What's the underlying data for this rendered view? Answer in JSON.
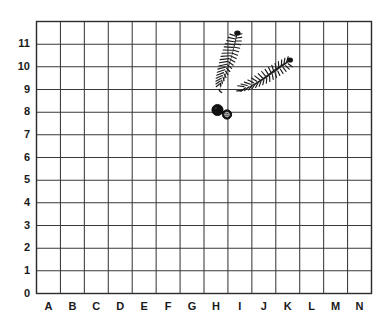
{
  "figure": {
    "kind": "excavation-grid-plot",
    "background_color": "#ffffff",
    "grid_line_color": "#3a3a3a",
    "artifact_color": "#1a1a1a"
  },
  "chart_data": {
    "type": "scatter",
    "title": "",
    "subtitle": "",
    "xlabel": "",
    "ylabel": "",
    "grid": true,
    "legend": "none",
    "x_axis": {
      "type": "category",
      "tick_labels": [
        "A",
        "B",
        "C",
        "D",
        "E",
        "F",
        "G",
        "H",
        "I",
        "J",
        "K",
        "L",
        "M",
        "N"
      ],
      "count": 14
    },
    "y_axis": {
      "type": "numeric",
      "tick_labels": [
        "0",
        "1",
        "2",
        "3",
        "4",
        "5",
        "6",
        "7",
        "8",
        "9",
        "10",
        "11"
      ],
      "ylim": [
        0,
        12
      ],
      "count": 12
    },
    "annotations": [
      {
        "name": "wheat-stalk-left",
        "shape": "curved-ear-of-wheat",
        "description": "Upright wheat ear curving from top tip down and left",
        "tip_x": "I",
        "tip_y": 11,
        "base_x": "I",
        "base_y": 9
      },
      {
        "name": "wheat-stalk-right",
        "shape": "curved-ear-of-wheat",
        "description": "Wheat ear curving from lower-left up to the right",
        "tip_x": "K",
        "tip_y": 10,
        "base_x": "I",
        "base_y": 9
      }
    ],
    "points": [
      {
        "name": "object-1",
        "label": "",
        "x": "H",
        "y": 8.0,
        "marker": "filled-circle",
        "size_px": 11
      },
      {
        "name": "object-2",
        "label": "",
        "x": "H",
        "y": 7.8,
        "marker": "circle-with-center",
        "size_px": 9
      }
    ]
  }
}
